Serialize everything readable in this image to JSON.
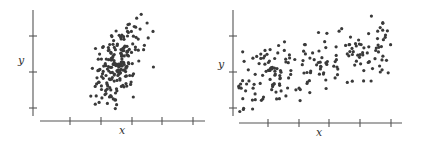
{
  "chart_data": [
    {
      "type": "scatter",
      "title": "",
      "xlabel": "x",
      "ylabel": "y",
      "grid": false,
      "legend": null,
      "description": "Moderate positive correlation; points concentrated in a narrow, tall elliptical cloud at the center of the x-range",
      "axes": {
        "y_axis": {
          "x": 33,
          "y_top": 10,
          "y_bottom": 116,
          "ticks_y": [
            36,
            72,
            108
          ]
        },
        "x_axis": {
          "y": 121,
          "x_left": 40,
          "x_right": 205,
          "ticks_x": [
            70,
            101,
            132,
            162,
            193
          ]
        },
        "xlabel_pos": [
          122,
          134
        ],
        "ylabel_pos": [
          21,
          64
        ]
      },
      "cloud": {
        "cx": 116,
        "cy": 68,
        "sx": 12,
        "sy": 22,
        "rho": 0.45,
        "n": 200,
        "seed": 7,
        "xmin": 84,
        "xmax": 156,
        "ymin": 11,
        "ymax": 112
      }
    },
    {
      "type": "scatter",
      "title": "",
      "xlabel": "x",
      "ylabel": "y",
      "grid": false,
      "legend": null,
      "description": "Positive correlation with wide spread; points span the full x-range with y increasing left to right",
      "axes": {
        "y_axis": {
          "x": 233,
          "y_top": 10,
          "y_bottom": 116,
          "ticks_y": [
            36,
            72,
            108
          ]
        },
        "x_axis": {
          "y": 123,
          "x_left": 239,
          "x_right": 402,
          "ticks_x": [
            268,
            299,
            329,
            360,
            391
          ]
        },
        "xlabel_pos": [
          319,
          136
        ],
        "ylabel_pos": [
          221,
          68
        ]
      },
      "trend": {
        "x0": 238,
        "x1": 391,
        "y_at_x0": 85,
        "y_at_x1": 42,
        "y_noise_sd": 15,
        "n": 200,
        "seed": 13,
        "ymin": 12,
        "ymax": 113
      }
    }
  ]
}
